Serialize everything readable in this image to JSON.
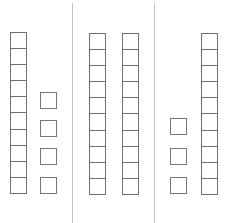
{
  "diagram": {
    "type": "base-ten blocks",
    "colors": {
      "stroke": "#6f6f6f",
      "divider": "#c4c4c4",
      "background": "#ffffff"
    },
    "panels": [
      {
        "id": "left",
        "tens_rods": 1,
        "ones_units": 4,
        "value": 14
      },
      {
        "id": "middle",
        "tens_rods": 2,
        "ones_units": 0,
        "value": 20
      },
      {
        "id": "right",
        "tens_rods": 1,
        "ones_units": 3,
        "value": 13
      }
    ],
    "cells_per_rod": 10
  }
}
